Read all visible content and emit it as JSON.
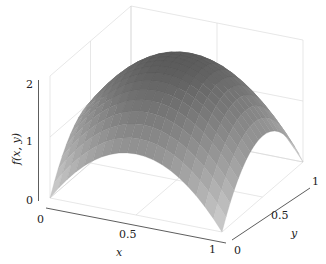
{
  "chart_data": {
    "type": "surface3d",
    "title": "",
    "function": "f(x,y) = 2*(1 - ((x-0.5)^2 + (y-0.5)^2)*... ) approx paraboloid, max ~2 at center, ~0 at corners",
    "xlabel": "x",
    "ylabel": "y",
    "zlabel": "f(x, y)",
    "xlim": [
      0,
      1
    ],
    "ylim": [
      0,
      1
    ],
    "zlim": [
      0,
      2
    ],
    "x_ticks": [
      "0",
      "0.5",
      "1"
    ],
    "y_ticks": [
      "0",
      "0.5",
      "1"
    ],
    "z_ticks": [
      "0",
      "1",
      "2"
    ],
    "grid": true,
    "colormap": "grayscale",
    "corner_values": {
      "f(0,0)": 0,
      "f(1,0)": 0,
      "f(0,1)": 0,
      "f(1,1)": 0
    },
    "center_value": 2,
    "mesh_resolution": 20
  },
  "axes": {
    "x_label": "x",
    "y_label": "y",
    "z_label": "f(x, y)",
    "x_ticks": [
      "0",
      "0.5",
      "1"
    ],
    "y_ticks": [
      "0",
      "0.5",
      "1"
    ],
    "z_ticks": [
      "0",
      "1",
      "2"
    ]
  }
}
